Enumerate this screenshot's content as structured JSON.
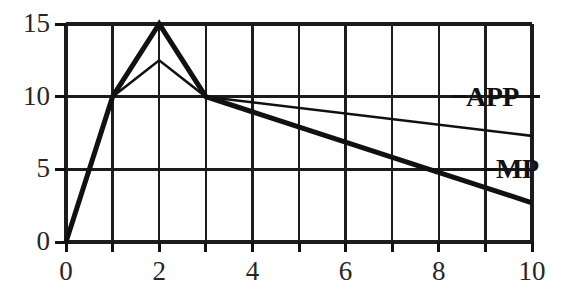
{
  "chart_data": {
    "type": "line",
    "title": "",
    "subtitle": "",
    "xlabel": "",
    "ylabel": "",
    "xlim": [
      0,
      10
    ],
    "ylim": [
      0,
      15
    ],
    "grid": true,
    "grid_x_step": 1,
    "grid_y_step": 5,
    "x_ticks": [
      0,
      1,
      2,
      3,
      4,
      5,
      6,
      7,
      8,
      9,
      10
    ],
    "x_tick_labels": [
      "0",
      "",
      "2",
      "",
      "4",
      "",
      "6",
      "",
      "8",
      "",
      "10"
    ],
    "y_ticks": [
      0,
      5,
      10,
      15
    ],
    "y_tick_labels": [
      "0",
      "5",
      "10",
      "15"
    ],
    "legend_position": "right-inline",
    "series": [
      {
        "name": "MP",
        "label": "MP",
        "style": "thick",
        "color": "#111111",
        "line_width": 5,
        "label_value_y": 5,
        "x": [
          0,
          1,
          2,
          3,
          10
        ],
        "values": [
          0,
          10,
          15,
          10,
          2.7
        ]
      },
      {
        "name": "APP",
        "label": "APP",
        "style": "thin",
        "color": "#111111",
        "line_width": 2.6,
        "label_value_y": 10,
        "x": [
          0,
          1,
          2,
          3,
          10
        ],
        "values": [
          0,
          10,
          12.5,
          10,
          7.3
        ]
      }
    ]
  },
  "axis_labels": {
    "y": [
      "15",
      "10",
      "5",
      "0"
    ],
    "x": [
      "0",
      "2",
      "4",
      "6",
      "8",
      "10"
    ]
  },
  "annotations": {
    "app_label": "APP",
    "mp_label": "MP"
  },
  "colors": {
    "line": "#111111",
    "grid": "#1c1c1c",
    "axis": "#111111",
    "text": "#262626",
    "background": "#ffffff"
  }
}
